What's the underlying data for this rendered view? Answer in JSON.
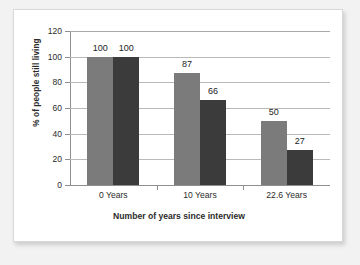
{
  "chart_data": {
    "type": "bar",
    "title": "",
    "subtitle": "",
    "categories": [
      "0 Years",
      "10 Years",
      "22.6 Years"
    ],
    "series": [
      {
        "name": "series-1",
        "color": "#7b7b7b",
        "values": [
          100,
          87,
          50
        ]
      },
      {
        "name": "series-2",
        "color": "#3b3b3b",
        "values": [
          100,
          66,
          27
        ]
      }
    ],
    "xlabel": "Number of years since interview",
    "ylabel": "% of people still living",
    "ylim": [
      0,
      120
    ],
    "ytick_step": 20,
    "yticks": [
      0,
      20,
      40,
      60,
      80,
      100,
      120
    ],
    "ytick_labels": [
      "0",
      "20",
      "40",
      "60",
      "80",
      "100",
      "120"
    ],
    "data_labels": [
      "100",
      "100",
      "87",
      "66",
      "50",
      "27"
    ],
    "grid": "horizontal",
    "legend": "none",
    "legend_position": "none",
    "annotations": []
  },
  "colors": {
    "page_background": "#f2f2f2",
    "card_background": "#ffffff",
    "series_1": "#7b7b7b",
    "series_2": "#3b3b3b",
    "gridline": "#b9b9b9",
    "axis": "#8f8f8f",
    "text": "#2b2b2b"
  }
}
